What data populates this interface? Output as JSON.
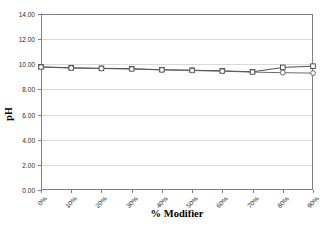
{
  "chart_data": {
    "type": "line",
    "title": "",
    "xlabel": "% Modifier",
    "ylabel": "pH",
    "x": [
      0,
      10,
      20,
      30,
      40,
      50,
      60,
      70,
      80,
      90
    ],
    "xtick_labels": [
      "0%",
      "10%",
      "20%",
      "30%",
      "40%",
      "50%",
      "60%",
      "70%",
      "80%",
      "90%"
    ],
    "ytick_labels": [
      "0.00",
      "2.00",
      "4.00",
      "6.00",
      "8.00",
      "10.00",
      "12.00",
      "14.00"
    ],
    "ytick_values": [
      0,
      2,
      4,
      6,
      8,
      10,
      12,
      14
    ],
    "ylim": [
      0,
      14
    ],
    "xlim": [
      0,
      90
    ],
    "grid": "horizontal",
    "legend": "none",
    "series": [
      {
        "name": "series-squares",
        "marker": "square",
        "color": "#404040",
        "values": [
          9.8,
          9.72,
          9.68,
          9.65,
          9.57,
          9.53,
          9.48,
          9.4,
          9.75,
          9.85
        ]
      },
      {
        "name": "series-circles",
        "marker": "circle",
        "color": "#595959",
        "values": [
          9.78,
          9.7,
          9.66,
          9.62,
          9.55,
          9.5,
          9.45,
          9.38,
          9.33,
          9.3
        ]
      }
    ]
  },
  "axes": {
    "y_axis_title": "pH",
    "x_axis_title": "% Modifier"
  },
  "colors": {
    "plot_border": "#808080",
    "gridline": "#d9d9d9",
    "background": "#ffffff",
    "tick_text": "#2b2b2b",
    "axis_title": "#000000"
  }
}
